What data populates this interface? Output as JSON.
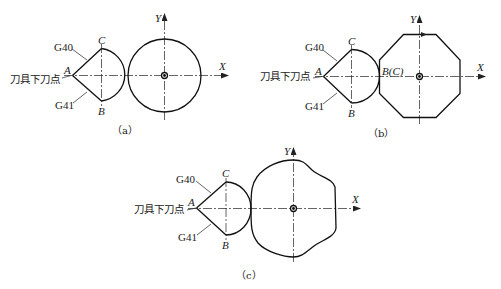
{
  "figure": {
    "panels": [
      {
        "id": "a",
        "caption": "（a）",
        "tool_entry_label": "刀具下刀点",
        "g40_label": "G40",
        "g41_label": "G41",
        "point_A": "A",
        "point_B": "B",
        "point_C": "C",
        "x_axis": "X",
        "y_axis": "Y",
        "contour": "circle"
      },
      {
        "id": "b",
        "caption": "（b）",
        "tool_entry_label": "刀具下刀点",
        "g40_label": "G40",
        "g41_label": "G41",
        "point_A": "A",
        "point_B": "B",
        "point_C": "C",
        "tangent_label": "B(C)",
        "x_axis": "X",
        "y_axis": "Y",
        "contour": "octagon"
      },
      {
        "id": "c",
        "caption": "（c）",
        "tool_entry_label": "刀具下刀点",
        "g40_label": "G40",
        "g41_label": "G41",
        "point_A": "A",
        "point_B": "B",
        "point_C": "C",
        "x_axis": "X",
        "y_axis": "Y",
        "contour": "free-form curve"
      }
    ]
  }
}
